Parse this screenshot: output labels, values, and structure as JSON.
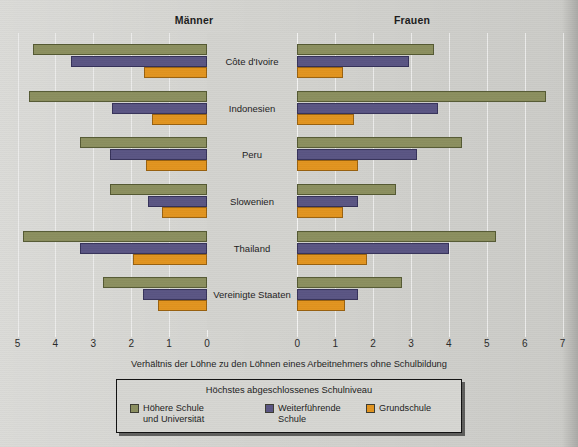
{
  "figure": {
    "panel_left_title": "Männer",
    "panel_right_title": "Frauen",
    "axis_caption": "Verhältnis der Löhne zu den Löhnen eines Arbeitnehmers ohne Schulbildung",
    "legend_title": "Höchstes abgeschlossenes Schulniveau"
  },
  "legend": {
    "items": [
      {
        "label": "Höhere Schule\nund Universität",
        "color": "#8b8f5f",
        "key": "higher"
      },
      {
        "label": "Weiterführende\nSchule",
        "color": "#5a5583",
        "key": "secondary"
      },
      {
        "label": "Grundschule",
        "color": "#e2941f",
        "key": "primary"
      }
    ]
  },
  "axis": {
    "left_ticks": [
      "5",
      "4",
      "3",
      "2",
      "1",
      "0"
    ],
    "right_ticks": [
      "0",
      "1",
      "2",
      "3",
      "4",
      "5",
      "6",
      "7"
    ]
  },
  "chart_data": {
    "type": "bar",
    "orientation": "horizontal",
    "layout": "diverging-pyramid",
    "title": "",
    "xlabel": "Verhältnis der Löhne zu den Löhnen eines Arbeitnehmers ohne Schulbildung",
    "ylabel": "",
    "legend_position": "bottom",
    "grid": true,
    "panels": [
      "Männer",
      "Frauen"
    ],
    "xlim_left": [
      0,
      5
    ],
    "xlim_right": [
      0,
      7
    ],
    "categories": [
      "Côte d'Ivoire",
      "Indonesien",
      "Peru",
      "Slowenien",
      "Thailand",
      "Vereinigte Staaten"
    ],
    "series": [
      {
        "name": "Höhere Schule und Universität",
        "color": "#8b8f5f",
        "maenner": [
          4.6,
          4.7,
          3.35,
          2.55,
          4.85,
          2.75
        ],
        "frauen": [
          3.6,
          6.55,
          4.35,
          2.6,
          5.25,
          2.75
        ]
      },
      {
        "name": "Weiterführende Schule",
        "color": "#5a5583",
        "maenner": [
          3.6,
          2.5,
          2.55,
          1.55,
          3.35,
          1.7
        ],
        "frauen": [
          2.95,
          3.7,
          3.15,
          1.6,
          4.0,
          1.6
        ]
      },
      {
        "name": "Grundschule",
        "color": "#e2941f",
        "maenner": [
          1.65,
          1.45,
          1.6,
          1.2,
          1.95,
          1.3
        ],
        "frauen": [
          1.2,
          1.5,
          1.6,
          1.2,
          1.85,
          1.25
        ]
      }
    ]
  }
}
